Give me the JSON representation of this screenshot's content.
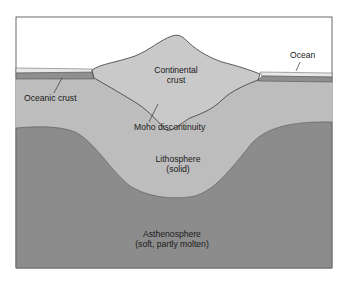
{
  "diagram": {
    "labels": {
      "ocean": "Ocean",
      "continental_crust_line1": "Continental",
      "continental_crust_line2": "crust",
      "oceanic_crust": "Oceanic crust",
      "moho": "Moho discontinuity",
      "lithosphere_line1": "Lithosphere",
      "lithosphere_line2": "(solid)",
      "asthenosphere_line1": "Asthenosphere",
      "asthenosphere_line2": "(soft, partly molten)"
    },
    "colors": {
      "sky": "#ffffff",
      "ocean": "#e6e6e6",
      "oceanic_crust": "#8f8f8f",
      "continental_crust": "#c9c9c9",
      "lithosphere": "#bdbdbd",
      "asthenosphere": "#8c8c8c",
      "outline": "#3a3a3a"
    }
  }
}
